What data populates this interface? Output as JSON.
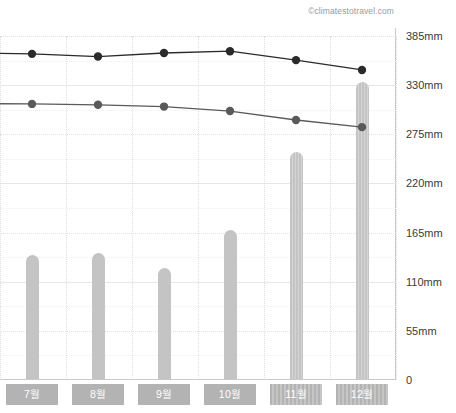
{
  "attribution": "©climatestotravel.com",
  "chart_data": {
    "type": "bar",
    "title": "",
    "subtitle": "",
    "xlabel": "",
    "ylabel": "",
    "ylim": [
      0,
      385
    ],
    "grid": true,
    "legend_position": "none",
    "units": "mm",
    "categories": [
      "7월",
      "8월",
      "9월",
      "10월",
      "11월",
      "12월"
    ],
    "ytick_labels": [
      "385mm",
      "330mm",
      "275mm",
      "220mm",
      "165mm",
      "110mm",
      "55mm",
      "0"
    ],
    "ytick_values": [
      385,
      330,
      275,
      220,
      165,
      110,
      55,
      0
    ],
    "bars": {
      "name": "Precipitation",
      "values": [
        140,
        142,
        125,
        168,
        255,
        333
      ],
      "color": "#c4c4c4",
      "striped_indices": [
        4,
        5
      ]
    },
    "series": [
      {
        "name": "Upper line",
        "type": "line",
        "values": [
          365,
          362,
          366,
          368,
          358,
          347
        ],
        "color": "#2b2b2b",
        "marker": "circle"
      },
      {
        "name": "Lower line",
        "type": "line",
        "values": [
          309,
          308,
          306,
          301,
          291,
          283
        ],
        "color": "#5a5a5a",
        "marker": "circle"
      }
    ]
  }
}
